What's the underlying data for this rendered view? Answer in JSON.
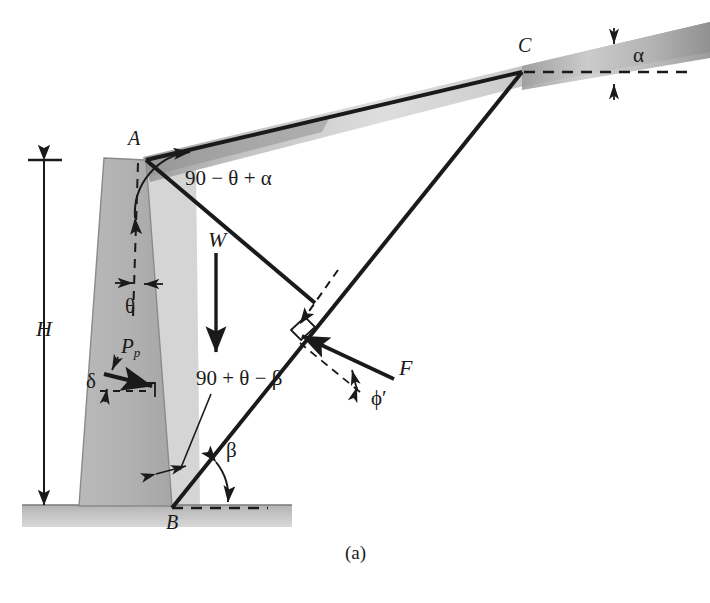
{
  "figure": {
    "caption": "(a)"
  },
  "points": {
    "A": "A",
    "B": "B",
    "C": "C"
  },
  "dimensions": {
    "height": "H"
  },
  "forces": {
    "weight": "W",
    "passive_pressure_symbol": "P",
    "passive_pressure_sub": "p",
    "reaction": "F"
  },
  "angles": {
    "alpha": "α",
    "beta": "β",
    "theta": "θ",
    "delta": "δ",
    "phi_prime": "ϕ′",
    "angle_at_A": "90 − θ + α",
    "angle_at_B": "90 + θ − β"
  },
  "colors": {
    "line": "#1a1a1a",
    "wall_fill": "#b6b6b6",
    "wall_edge": "#8f8f8f",
    "soil_light": "#d9d9d9",
    "soil_mid": "#bdbdbd",
    "soil_dark": "#9a9a9a",
    "ground": "#c2c2c2",
    "background": "#ffffff"
  },
  "geometry": {
    "point_A": [
      146,
      160
    ],
    "point_B": [
      172,
      508
    ],
    "point_C": [
      522,
      72
    ],
    "ground_line_y": 505,
    "wall_top_left": [
      104,
      158
    ],
    "wall_bottom_left": [
      79,
      506
    ]
  }
}
